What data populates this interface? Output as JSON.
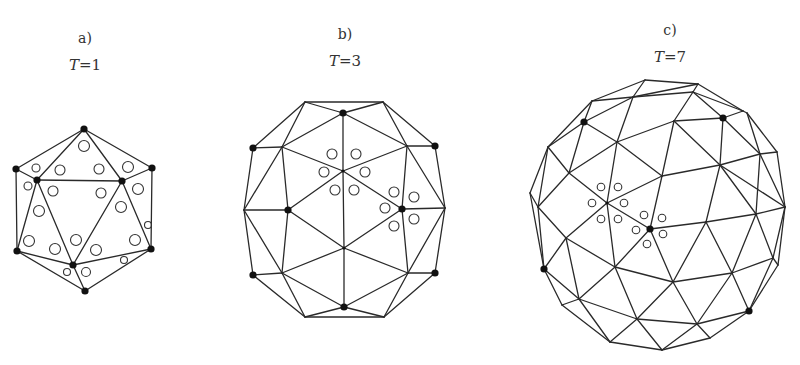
{
  "figure": {
    "panels": [
      {
        "id": "a",
        "label": "a)",
        "t_symbol": "T",
        "t_value": "=1",
        "label_pos": [
          85,
          38
        ],
        "t_pos": [
          85,
          66
        ],
        "vertices": {
          "top": [
            84,
            129
          ],
          "left": [
            16,
            169
          ],
          "innerL": [
            37,
            180
          ],
          "innerR": [
            122,
            181
          ],
          "right": [
            152,
            168
          ],
          "botL": [
            17,
            251
          ],
          "botR": [
            151,
            249
          ],
          "innerB": [
            73,
            265
          ],
          "bottom": [
            85,
            291
          ]
        },
        "edges": [
          [
            "top",
            "left"
          ],
          [
            "top",
            "innerL"
          ],
          [
            "top",
            "innerR"
          ],
          [
            "top",
            "right"
          ],
          [
            "left",
            "innerL"
          ],
          [
            "innerL",
            "innerR"
          ],
          [
            "innerR",
            "right"
          ],
          [
            "left",
            "botL"
          ],
          [
            "right",
            "botR"
          ],
          [
            "innerL",
            "botL"
          ],
          [
            "innerL",
            "innerB"
          ],
          [
            "innerR",
            "innerB"
          ],
          [
            "innerR",
            "botR"
          ],
          [
            "botL",
            "innerB"
          ],
          [
            "innerB",
            "botR"
          ],
          [
            "botL",
            "bottom"
          ],
          [
            "innerB",
            "bottom"
          ],
          [
            "botR",
            "bottom"
          ]
        ],
        "dots": [
          "top",
          "left",
          "innerL",
          "innerR",
          "right",
          "botL",
          "botR",
          "innerB",
          "bottom"
        ],
        "rings": [
          [
            84,
            146,
            5.5
          ],
          [
            36,
            168,
            4
          ],
          [
            60,
            170,
            5
          ],
          [
            99,
            169,
            5
          ],
          [
            128,
            167,
            5.5
          ],
          [
            28,
            186,
            4
          ],
          [
            53,
            191,
            5
          ],
          [
            101,
            193,
            5
          ],
          [
            138,
            189,
            5.5
          ],
          [
            39,
            211,
            5.5
          ],
          [
            121,
            207,
            5.5
          ],
          [
            148,
            225,
            3.5
          ],
          [
            29,
            241,
            5.5
          ],
          [
            55,
            249,
            5.5
          ],
          [
            76,
            240,
            5.5
          ],
          [
            96,
            250,
            5.5
          ],
          [
            135,
            240,
            5.5
          ],
          [
            124,
            260,
            3.5
          ],
          [
            67,
            272,
            3.5
          ],
          [
            86,
            272,
            4.5
          ]
        ]
      },
      {
        "id": "b",
        "label": "b)",
        "t_symbol": "T",
        "t_value": "=3",
        "label_pos": [
          345,
          34
        ],
        "t_pos": [
          345,
          62
        ],
        "vertices": {
          "tl": [
            305,
            102
          ],
          "tr": [
            383,
            102
          ],
          "top": [
            343,
            113
          ],
          "lDot": [
            253,
            148
          ],
          "rDot": [
            435,
            146
          ],
          "iTL": [
            282,
            147
          ],
          "iTR": [
            407,
            146
          ],
          "c": [
            343,
            171
          ],
          "lFar": [
            244,
            210
          ],
          "lIn": [
            288,
            210
          ],
          "rIn": [
            402,
            209
          ],
          "rFar": [
            445,
            208
          ],
          "lc": [
            344,
            248
          ],
          "bLDot": [
            253,
            275
          ],
          "iBL": [
            282,
            273
          ],
          "iBR": [
            408,
            273
          ],
          "bRDot": [
            435,
            273
          ],
          "bottom": [
            344,
            307
          ],
          "bl": [
            305,
            317
          ],
          "br": [
            384,
            317
          ]
        },
        "edges": [
          [
            "tl",
            "tr"
          ],
          [
            "tl",
            "top"
          ],
          [
            "tr",
            "top"
          ],
          [
            "tl",
            "lDot"
          ],
          [
            "tl",
            "iTL"
          ],
          [
            "tr",
            "rDot"
          ],
          [
            "tr",
            "iTR"
          ],
          [
            "top",
            "iTL"
          ],
          [
            "top",
            "iTR"
          ],
          [
            "top",
            "c"
          ],
          [
            "lDot",
            "iTL"
          ],
          [
            "rDot",
            "iTR"
          ],
          [
            "lDot",
            "lFar"
          ],
          [
            "rDot",
            "rFar"
          ],
          [
            "iTL",
            "lFar"
          ],
          [
            "iTL",
            "lIn"
          ],
          [
            "iTL",
            "c"
          ],
          [
            "iTR",
            "c"
          ],
          [
            "iTR",
            "rIn"
          ],
          [
            "iTR",
            "rFar"
          ],
          [
            "c",
            "lIn"
          ],
          [
            "c",
            "rIn"
          ],
          [
            "c",
            "lc"
          ],
          [
            "lFar",
            "lIn"
          ],
          [
            "rIn",
            "rFar"
          ],
          [
            "lFar",
            "bLDot"
          ],
          [
            "lFar",
            "iBL"
          ],
          [
            "lIn",
            "iBL"
          ],
          [
            "lIn",
            "lc"
          ],
          [
            "rIn",
            "lc"
          ],
          [
            "rIn",
            "iBR"
          ],
          [
            "rFar",
            "iBR"
          ],
          [
            "rFar",
            "bRDot"
          ],
          [
            "lc",
            "iBL"
          ],
          [
            "lc",
            "iBR"
          ],
          [
            "lc",
            "bottom"
          ],
          [
            "bLDot",
            "iBL"
          ],
          [
            "iBR",
            "bRDot"
          ],
          [
            "iBL",
            "bottom"
          ],
          [
            "iBR",
            "bottom"
          ],
          [
            "iBL",
            "bl"
          ],
          [
            "iBR",
            "br"
          ],
          [
            "bLDot",
            "bl"
          ],
          [
            "bRDot",
            "br"
          ],
          [
            "bl",
            "bottom"
          ],
          [
            "br",
            "bottom"
          ],
          [
            "bl",
            "br"
          ]
        ],
        "dots": [
          "top",
          "lDot",
          "rDot",
          "lIn",
          "rIn",
          "bLDot",
          "bRDot",
          "bottom"
        ],
        "small_dots": [
          "c",
          "lc"
        ],
        "rings": [
          [
            332,
            154,
            5
          ],
          [
            356,
            154,
            5
          ],
          [
            324,
            172,
            5
          ],
          [
            365,
            172,
            5
          ],
          [
            335,
            190,
            5
          ],
          [
            354,
            190,
            5
          ],
          [
            394,
            192,
            5
          ],
          [
            414,
            197,
            5
          ],
          [
            385,
            208,
            5
          ],
          [
            414,
            219,
            5
          ],
          [
            394,
            226,
            5
          ]
        ]
      },
      {
        "id": "c",
        "label": "c)",
        "t_symbol": "T",
        "t_value": "=7",
        "label_pos": [
          670,
          30
        ],
        "t_pos": [
          670,
          58
        ],
        "vertices": {
          "t1": [
            645,
            80
          ],
          "t2": [
            698,
            84
          ],
          "a1": [
            592,
            101
          ],
          "a2": [
            633,
            97
          ],
          "a3": [
            693,
            92
          ],
          "a4": [
            743,
            111
          ],
          "d1": [
            584,
            122
          ],
          "b2": [
            674,
            121
          ],
          "d2": [
            723,
            118
          ],
          "b4": [
            747,
            113
          ],
          "c1": [
            548,
            147
          ],
          "c2": [
            617,
            142
          ],
          "c3": [
            760,
            154
          ],
          "c4": [
            777,
            152
          ],
          "e1": [
            569,
            173
          ],
          "e2": [
            662,
            176
          ],
          "e3": [
            720,
            165
          ],
          "f0": [
            530,
            193
          ],
          "f1": [
            538,
            207
          ],
          "f2": [
            607,
            203
          ],
          "f3": [
            785,
            207
          ],
          "g1": [
            650,
            229
          ],
          "g2": [
            706,
            222
          ],
          "g3": [
            756,
            214
          ],
          "h1": [
            566,
            238
          ],
          "h0": [
            544,
            269
          ],
          "h2": [
            615,
            267
          ],
          "i1": [
            673,
            282
          ],
          "i2": [
            732,
            273
          ],
          "i3": [
            773,
            258
          ],
          "i4": [
            778,
            265
          ],
          "j1": [
            579,
            299
          ],
          "j0": [
            562,
            305
          ],
          "j2": [
            749,
            311
          ],
          "k1": [
            637,
            319
          ],
          "k2": [
            697,
            324
          ],
          "l1": [
            610,
            342
          ],
          "l2": [
            662,
            350
          ],
          "l3": [
            710,
            338
          ]
        },
        "edges": [
          [
            "t1",
            "t2"
          ],
          [
            "t1",
            "a1"
          ],
          [
            "t1",
            "a2"
          ],
          [
            "t2",
            "a2"
          ],
          [
            "t2",
            "a3"
          ],
          [
            "t2",
            "a4"
          ],
          [
            "a1",
            "a2"
          ],
          [
            "a2",
            "a3"
          ],
          [
            "a3",
            "a4"
          ],
          [
            "a1",
            "d1"
          ],
          [
            "a1",
            "c1"
          ],
          [
            "a2",
            "d1"
          ],
          [
            "a2",
            "c2"
          ],
          [
            "a3",
            "b2"
          ],
          [
            "a3",
            "d2"
          ],
          [
            "a4",
            "d2"
          ],
          [
            "a4",
            "b4"
          ],
          [
            "d1",
            "c1"
          ],
          [
            "d1",
            "c2"
          ],
          [
            "d1",
            "e1"
          ],
          [
            "c2",
            "b2"
          ],
          [
            "b2",
            "d2"
          ],
          [
            "b2",
            "e2"
          ],
          [
            "b2",
            "e3"
          ],
          [
            "d2",
            "e3"
          ],
          [
            "d2",
            "c3"
          ],
          [
            "b4",
            "c3"
          ],
          [
            "b4",
            "c4"
          ],
          [
            "c3",
            "c4"
          ],
          [
            "c1",
            "e1"
          ],
          [
            "c1",
            "f0"
          ],
          [
            "c1",
            "f1"
          ],
          [
            "c2",
            "e1"
          ],
          [
            "c2",
            "f2"
          ],
          [
            "c2",
            "e2"
          ],
          [
            "e3",
            "c3"
          ],
          [
            "e3",
            "g2"
          ],
          [
            "e3",
            "g3"
          ],
          [
            "c3",
            "g3"
          ],
          [
            "c4",
            "f3"
          ],
          [
            "c3",
            "f3"
          ],
          [
            "e1",
            "f1"
          ],
          [
            "e1",
            "f2"
          ],
          [
            "e2",
            "f2"
          ],
          [
            "e2",
            "g1"
          ],
          [
            "e2",
            "e3"
          ],
          [
            "e3",
            "f3"
          ],
          [
            "f0",
            "f1"
          ],
          [
            "f0",
            "h0"
          ],
          [
            "f1",
            "h1"
          ],
          [
            "f1",
            "h0"
          ],
          [
            "f2",
            "h1"
          ],
          [
            "f2",
            "g1"
          ],
          [
            "f2",
            "h2"
          ],
          [
            "g1",
            "g2"
          ],
          [
            "g1",
            "h2"
          ],
          [
            "g1",
            "i1"
          ],
          [
            "g2",
            "g3"
          ],
          [
            "g2",
            "i1"
          ],
          [
            "g2",
            "i2"
          ],
          [
            "g3",
            "f3"
          ],
          [
            "g3",
            "i2"
          ],
          [
            "g3",
            "i3"
          ],
          [
            "f3",
            "i3"
          ],
          [
            "f3",
            "i4"
          ],
          [
            "h1",
            "h0"
          ],
          [
            "h1",
            "h2"
          ],
          [
            "h1",
            "j1"
          ],
          [
            "h0",
            "j1"
          ],
          [
            "h0",
            "j0"
          ],
          [
            "h2",
            "i1"
          ],
          [
            "h2",
            "j1"
          ],
          [
            "h2",
            "k1"
          ],
          [
            "i1",
            "i2"
          ],
          [
            "i1",
            "k1"
          ],
          [
            "i1",
            "k2"
          ],
          [
            "i2",
            "k2"
          ],
          [
            "i2",
            "j2"
          ],
          [
            "i2",
            "i3"
          ],
          [
            "i3",
            "j2"
          ],
          [
            "i3",
            "i4"
          ],
          [
            "i4",
            "j2"
          ],
          [
            "j0",
            "j1"
          ],
          [
            "j0",
            "l1"
          ],
          [
            "j1",
            "l1"
          ],
          [
            "j1",
            "k1"
          ],
          [
            "k1",
            "l1"
          ],
          [
            "k1",
            "l2"
          ],
          [
            "k1",
            "k2"
          ],
          [
            "k2",
            "l2"
          ],
          [
            "k2",
            "l3"
          ],
          [
            "k2",
            "j2"
          ],
          [
            "j2",
            "l3"
          ],
          [
            "l1",
            "l2"
          ],
          [
            "l2",
            "l3"
          ]
        ],
        "dots": [
          "d1",
          "d2",
          "h0",
          "g1",
          "j2"
        ],
        "small_dots": [
          "f2"
        ],
        "rings": [
          [
            601,
            187,
            3.8
          ],
          [
            618,
            187,
            3.8
          ],
          [
            592,
            203,
            3.8
          ],
          [
            624,
            203,
            3.8
          ],
          [
            601,
            219,
            3.8
          ],
          [
            618,
            219,
            3.8
          ],
          [
            644,
            215,
            3.8
          ],
          [
            662,
            218,
            3.8
          ],
          [
            636,
            230,
            3.8
          ],
          [
            663,
            234,
            3.8
          ],
          [
            647,
            244,
            3.8
          ]
        ]
      }
    ]
  }
}
